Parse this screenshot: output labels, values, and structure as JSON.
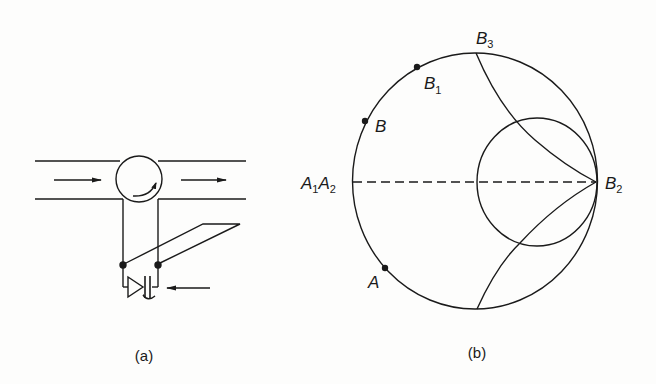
{
  "figure": {
    "panels": [
      {
        "id": "a",
        "caption": "(a)",
        "description": "Waveguide with circulator/junction, detector diode and bias/output lead",
        "components": [
          "waveguide-top-wall",
          "waveguide-bottom-wall",
          "junction-circle",
          "rotation-arrow",
          "input-wave-arrow",
          "output-wave-arrow",
          "lead-left",
          "lead-right",
          "node-dots",
          "parallelogram-loop",
          "diode",
          "capacitor",
          "incident-arrow"
        ]
      },
      {
        "id": "b",
        "caption": "(b)",
        "description": "Smith-chart style diagram with outer unit circle, inner circle tangent at B2, and two arcs meeting at B2",
        "labels": {
          "A1_main": "A",
          "A1_sub": "1",
          "A2_main": "A",
          "A2_sub": "2",
          "B": "B",
          "B1_main": "B",
          "B1_sub": "1",
          "B2_main": "B",
          "B2_sub": "2",
          "B3_main": "B",
          "B3_sub": "3",
          "A": "A"
        },
        "points": [
          "A",
          "B",
          "B1"
        ],
        "lines": [
          "dashed-diameter A1A2-B2"
        ]
      }
    ]
  },
  "colors": {
    "ink": "#1a1a1a",
    "paper": "#fdfdfc"
  }
}
